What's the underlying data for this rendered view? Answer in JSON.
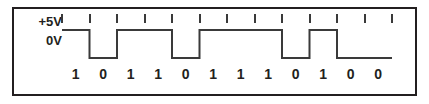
{
  "figure": {
    "frame_color": "#231f20",
    "background_color": "#ffffff"
  },
  "axis": {
    "high_label": "+5V",
    "low_label": "0V",
    "label_color": "#231f20"
  },
  "waveform": {
    "trace_color": "#3a3a3a",
    "trace_width": 2,
    "tick_color": "#3a3a3a",
    "tick_count": 13,
    "bit_width_px": 27.5,
    "start_x_px": 4,
    "high_y_px": 4,
    "low_y_px": 32
  },
  "chart_data": {
    "type": "line",
    "xlabel": "",
    "ylabel": "Voltage",
    "ylim": [
      0,
      5
    ],
    "grid": false,
    "legend": "none",
    "y_tick_labels": [
      "+5V",
      "0V"
    ],
    "categories": [
      "1",
      "2",
      "3",
      "4",
      "5",
      "6",
      "7",
      "8",
      "9",
      "10",
      "11",
      "12"
    ],
    "bits": [
      "1",
      "0",
      "1",
      "1",
      "0",
      "1",
      "1",
      "1",
      "0",
      "1",
      "0",
      "0"
    ],
    "values": [
      5,
      0,
      5,
      5,
      0,
      5,
      5,
      5,
      0,
      5,
      0,
      0
    ],
    "annotations": [
      "+5V",
      "0V"
    ]
  }
}
